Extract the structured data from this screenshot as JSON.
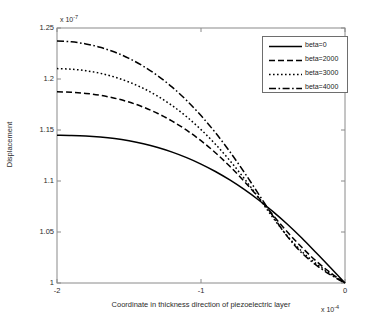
{
  "chart_data": {
    "type": "line",
    "title": "",
    "xlabel": "Coordinate in thickness direction of piezoelectric layer",
    "ylabel": "Displacement",
    "x_multiplier": "x 10",
    "x_exponent": "-4",
    "y_multiplier": "x 10",
    "y_exponent": "-7",
    "xlim": [
      -2,
      0
    ],
    "ylim": [
      1,
      1.25
    ],
    "xticks": [
      "-2",
      "-1",
      "0"
    ],
    "xtick_values": [
      -2,
      -1,
      0
    ],
    "yticks": [
      "1",
      "1.05",
      "1.1",
      "1.15",
      "1.2",
      "1.25"
    ],
    "ytick_values": [
      1,
      1.05,
      1.1,
      1.15,
      1.2,
      1.25
    ],
    "grid": false,
    "legend_position": "top-right",
    "x": [
      -2,
      -1.9,
      -1.8,
      -1.7,
      -1.6,
      -1.5,
      -1.4,
      -1.3,
      -1.2,
      -1.1,
      -1,
      -0.9,
      -0.8,
      -0.7,
      -0.6,
      -0.5,
      -0.4,
      -0.3,
      -0.2,
      -0.1,
      0
    ],
    "series": [
      {
        "name": "beta=0",
        "style": "solid",
        "color": "#000000",
        "values": [
          1.1448,
          1.1446,
          1.1441,
          1.1431,
          1.1416,
          1.1394,
          1.1365,
          1.1328,
          1.1283,
          1.1229,
          1.1166,
          1.1093,
          1.101,
          1.0917,
          1.0814,
          1.07,
          1.0576,
          1.0441,
          1.0296,
          1.015,
          1.0
        ]
      },
      {
        "name": "beta=2000",
        "style": "dashed",
        "color": "#000000",
        "values": [
          1.1874,
          1.187,
          1.1859,
          1.184,
          1.1812,
          1.1774,
          1.1724,
          1.1662,
          1.1587,
          1.1498,
          1.1395,
          1.1277,
          1.1144,
          1.0997,
          1.0837,
          1.0665,
          1.05,
          1.035,
          1.0215,
          1.01,
          1.0
        ]
      },
      {
        "name": "beta=3000",
        "style": "dotted",
        "color": "#000000",
        "values": [
          1.2102,
          1.2096,
          1.2081,
          1.2056,
          1.2019,
          1.197,
          1.1908,
          1.1831,
          1.1739,
          1.163,
          1.1504,
          1.1361,
          1.1201,
          1.1025,
          1.0836,
          1.064,
          1.046,
          1.031,
          1.019,
          1.009,
          1.0
        ]
      },
      {
        "name": "beta=4000",
        "style": "dashdot",
        "color": "#000000",
        "values": [
          1.2372,
          1.2364,
          1.2344,
          1.2311,
          1.2264,
          1.2202,
          1.2125,
          1.2031,
          1.192,
          1.179,
          1.1641,
          1.1474,
          1.1288,
          1.1086,
          1.0872,
          1.0655,
          1.0455,
          1.0295,
          1.0175,
          1.008,
          1.0
        ]
      }
    ]
  },
  "legend": {
    "entries": [
      {
        "label": "beta=0"
      },
      {
        "label": "beta=2000"
      },
      {
        "label": "beta=3000"
      },
      {
        "label": "beta=4000"
      }
    ]
  }
}
